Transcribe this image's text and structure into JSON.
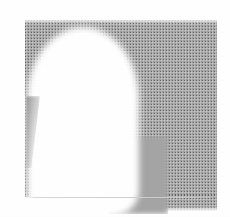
{
  "image": {
    "kind": "scanned-halftone-grayscale-photograph",
    "width_px": 230,
    "height_px": 217,
    "caption": "",
    "alt_text": "Low-resolution halftoned grayscale scan showing a large white dome-shaped silhouette against a dithered gray field",
    "background_color": "#ffffff",
    "text_content": []
  },
  "regions": {
    "gray_plate": {
      "name": "gray-plate",
      "color": "#9c9c9c",
      "x": 25,
      "y": 20,
      "width": 192,
      "height": 177,
      "texture": "halftone-dither"
    },
    "white_dome": {
      "name": "white-dome-silhouette",
      "color": "#ffffff",
      "x": 27,
      "y": 27,
      "width": 112,
      "height": 190
    },
    "gray_bleed_bottom": {
      "name": "gray-bleed-below-plate",
      "color": "#9c9c9c",
      "x": 139,
      "y": 195,
      "width": 78,
      "height": 16
    },
    "left_sliver": {
      "name": "tapering-gray-sliver",
      "color": "#8c8c8c",
      "x": 26,
      "y": 96,
      "width": 14,
      "height": 72
    },
    "gray_shoulder": {
      "name": "gray-shoulder-sweep",
      "color": "#9c9c9c",
      "x": 96,
      "y": 136,
      "width": 72,
      "height": 78
    },
    "baseline_rule": {
      "name": "faint-horizontal-rule",
      "color": "#cfcfcf",
      "x": 25,
      "y": 197,
      "width": 187,
      "height": 1
    }
  },
  "palette": {
    "paper_white": "#ffffff",
    "halftone_gray": "#9c9c9c",
    "halftone_dark_dot": "#3c3c3c",
    "shadow_gray": "#8c8c8c",
    "rule_gray": "#cfcfcf"
  }
}
